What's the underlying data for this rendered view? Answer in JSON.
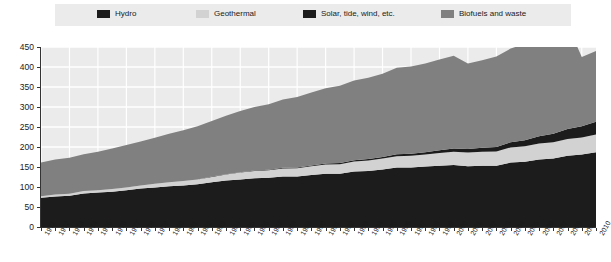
{
  "legend": {
    "position": "top",
    "background": "#ebebeb",
    "items": [
      {
        "label": "Hydro",
        "color": "#1c1c1c",
        "x": 97
      },
      {
        "label": "Geothermal",
        "color": "#d2d2d2",
        "x": 196
      },
      {
        "label": "Solar, tide, wind, etc.",
        "color": "#1c1c1c",
        "x": 303
      },
      {
        "label": "Biofuels and waste",
        "color": "#808080",
        "x": 441
      }
    ]
  },
  "colors": {
    "plot_background": "#ebebeb",
    "gridline": "#ffffff",
    "axis": "#333333",
    "hydro": "#1c1c1c",
    "geothermal": "#d2d2d2",
    "solar": "#1c1c1c",
    "biofuels": "#808080",
    "text": "#1a1a1a"
  },
  "chart_data": {
    "type": "area",
    "stacked": true,
    "title": "",
    "subtitle": "",
    "xlabel": "",
    "ylabel": "",
    "grid": true,
    "legend_position": "top",
    "xlim": [
      1971,
      2010
    ],
    "ylim": [
      0,
      450
    ],
    "yticks": [
      0,
      50,
      100,
      150,
      200,
      250,
      300,
      350,
      400,
      450
    ],
    "ytick_labels": [
      "0",
      "50",
      "100",
      "150",
      "200",
      "250",
      "300",
      "350",
      "400",
      "450"
    ],
    "categories": [
      "1971",
      "1972",
      "1973",
      "1974",
      "1975",
      "1976",
      "1977",
      "1978",
      "1979",
      "1980",
      "1981",
      "1982",
      "1983",
      "1984",
      "1985",
      "1986",
      "1987",
      "1988",
      "1989",
      "1990",
      "1991",
      "1992",
      "1993",
      "1994",
      "1995",
      "1996",
      "1997",
      "1998",
      "1999",
      "2000",
      "2001",
      "2002",
      "2003",
      "2004",
      "2005",
      "2006",
      "2007",
      "2008",
      "2009",
      "2010"
    ],
    "series": [
      {
        "name": "Hydro",
        "color": "#1c1c1c",
        "values": [
          73,
          76,
          78,
          84,
          86,
          88,
          92,
          96,
          99,
          102,
          104,
          107,
          112,
          116,
          119,
          122,
          123,
          126,
          126,
          130,
          133,
          133,
          139,
          140,
          144,
          149,
          149,
          151,
          153,
          155,
          152,
          153,
          153,
          161,
          163,
          169,
          171,
          178,
          181,
          187
        ]
      },
      {
        "name": "Geothermal",
        "color": "#d2d2d2",
        "values": [
          4,
          5,
          5,
          6,
          6,
          7,
          7,
          8,
          9,
          10,
          11,
          12,
          13,
          15,
          17,
          18,
          19,
          20,
          21,
          22,
          23,
          24,
          25,
          26,
          27,
          28,
          29,
          30,
          32,
          33,
          34,
          35,
          36,
          38,
          39,
          40,
          41,
          42,
          43,
          44
        ]
      },
      {
        "name": "Solar, tide, wind, etc.",
        "color": "#1c1c1c",
        "values": [
          0,
          0,
          0,
          0,
          0,
          0,
          0,
          0,
          0,
          0,
          0,
          0,
          1,
          1,
          1,
          1,
          1,
          2,
          2,
          2,
          3,
          3,
          3,
          4,
          4,
          5,
          5,
          6,
          7,
          8,
          9,
          10,
          11,
          13,
          15,
          18,
          21,
          25,
          28,
          32
        ]
      },
      {
        "name": "Biofuels and waste",
        "color": "#808080",
        "values": [
          84,
          88,
          90,
          92,
          96,
          101,
          106,
          110,
          115,
          121,
          127,
          133,
          139,
          146,
          153,
          159,
          164,
          171,
          176,
          182,
          188,
          193,
          199,
          203,
          208,
          216,
          218,
          222,
          227,
          232,
          214,
          219,
          226,
          234,
          241,
          248,
          253,
          261,
          173,
          177
        ]
      }
    ],
    "totals": [
      161,
      169,
      173,
      182,
      188,
      196,
      205,
      214,
      223,
      233,
      242,
      252,
      265,
      278,
      290,
      300,
      307,
      319,
      325,
      336,
      347,
      353,
      366,
      373,
      383,
      398,
      401,
      409,
      419,
      428,
      409,
      417,
      426,
      446,
      458,
      475,
      486,
      506,
      425,
      440
    ]
  }
}
